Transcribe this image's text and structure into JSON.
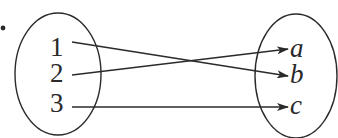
{
  "diagram": {
    "type": "mapping",
    "bullet": "•",
    "domain_set": {
      "elements": [
        "1",
        "2",
        "3"
      ]
    },
    "codomain_set": {
      "elements": [
        "a",
        "b",
        "c"
      ]
    },
    "mappings": [
      {
        "from": "1",
        "to": "b"
      },
      {
        "from": "2",
        "to": "a"
      },
      {
        "from": "3",
        "to": "c"
      }
    ],
    "colors": {
      "stroke": "#2a2a2a",
      "background": "#ffffff"
    }
  }
}
